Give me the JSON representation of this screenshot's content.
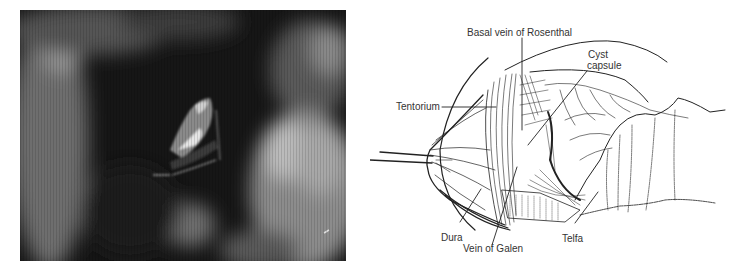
{
  "figure": {
    "photo": {
      "description": "Intraoperative photograph",
      "alt": "Intraoperative endoscopic view"
    },
    "illustration": {
      "labels": {
        "basal_vein": "Basal vein of Rosenthal",
        "cyst_line1": "Cyst",
        "cyst_line2": "capsule",
        "tentorium": "Tentorium",
        "dura": "Dura",
        "vein_of_galen": "Vein of Galen",
        "telfa": "Telfa"
      }
    }
  }
}
